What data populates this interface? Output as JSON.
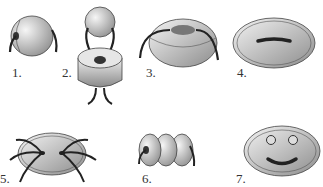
{
  "diagram": {
    "title": "",
    "items": [
      {
        "label": "1.",
        "description": "ball button with side thread"
      },
      {
        "label": "2.",
        "description": "ball on top of shank button with thread"
      },
      {
        "label": "3.",
        "description": "domed button with thread over top"
      },
      {
        "label": "4.",
        "description": "oval flat button with slot"
      },
      {
        "label": "5.",
        "description": "oval button with crossing threads"
      },
      {
        "label": "6.",
        "description": "three stacked discs with thread"
      },
      {
        "label": "7.",
        "description": "smiley face oval button"
      }
    ]
  },
  "colors": {
    "thread": "#222222",
    "button_light": "#f2f2f2",
    "button_dark": "#9a9a9a",
    "outline": "#444444"
  }
}
